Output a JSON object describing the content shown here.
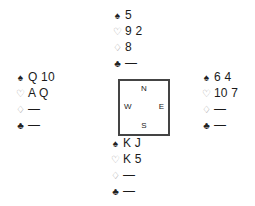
{
  "suits": {
    "spades": "♠",
    "hearts": "♡",
    "diamonds": "♢",
    "clubs": "♣"
  },
  "hands": {
    "north": {
      "spades": "5",
      "hearts": "9 2",
      "diamonds": "8",
      "clubs": "—"
    },
    "west": {
      "spades": "Q 10",
      "hearts": "A Q",
      "diamonds": "—",
      "clubs": "—"
    },
    "east": {
      "spades": "6 4",
      "hearts": "10 7",
      "diamonds": "—",
      "clubs": "—"
    },
    "south": {
      "spades": "K J",
      "hearts": "K 5",
      "diamonds": "—",
      "clubs": "—"
    }
  },
  "compass": {
    "north": "N",
    "south": "S",
    "west": "W",
    "east": "E"
  },
  "colors": {
    "border": "#444444",
    "text": "#1a1a1a",
    "red_suit_outline": "#9a9a9a"
  }
}
